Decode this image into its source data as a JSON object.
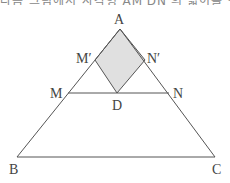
{
  "caption_fragment": "다음 그림에서 사각형 AM′DN′의 넓이를 구하시오.",
  "diagram": {
    "type": "triangle-with-rhombus",
    "points": {
      "A": {
        "label": "A",
        "x": 120,
        "y": 29
      },
      "B": {
        "label": "B",
        "x": 17,
        "y": 157
      },
      "C": {
        "label": "C",
        "x": 215,
        "y": 157
      },
      "M": {
        "label": "M",
        "x": 68,
        "y": 93
      },
      "N": {
        "label": "N",
        "x": 169,
        "y": 93
      },
      "D": {
        "label": "D",
        "x": 117,
        "y": 93
      },
      "M_prime": {
        "label": "M′",
        "x": 95,
        "y": 60
      },
      "N_prime": {
        "label": "N′",
        "x": 145,
        "y": 60
      }
    },
    "shaded_region": [
      "A",
      "M′",
      "D",
      "N′"
    ],
    "colors": {
      "line": "#555555",
      "fill": "#e0e0e0",
      "label": "#444444"
    }
  }
}
